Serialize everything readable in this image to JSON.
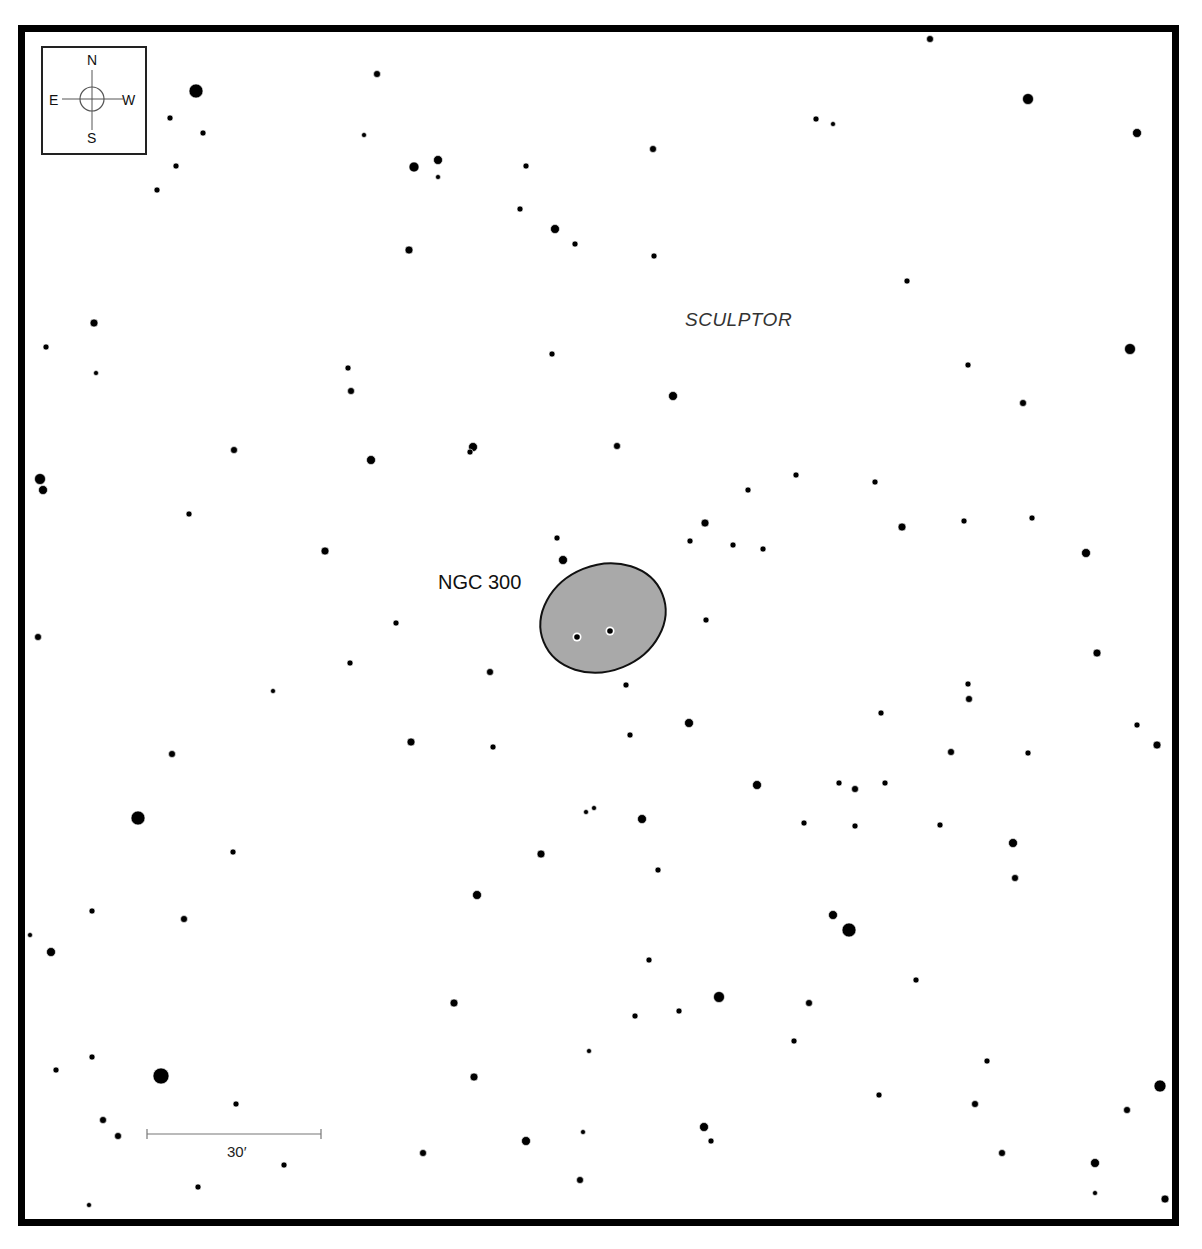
{
  "chart_data": {
    "type": "scatter",
    "constellation": "SCULPTOR",
    "object": {
      "name": "NGC 300",
      "shape": "ellipse",
      "center": [
        603,
        618
      ],
      "rx": 64,
      "ry": 53,
      "rotation_deg": -22,
      "fill": "#a9a9a9",
      "stroke": "#111111",
      "embedded_stars": [
        [
          577,
          637
        ],
        [
          610,
          631
        ]
      ]
    },
    "compass": {
      "N": "N",
      "S": "S",
      "E": "E",
      "W": "W"
    },
    "scale_bar": {
      "label": "30′",
      "x1": 147,
      "x2": 321,
      "y": 1134
    },
    "stars": [
      [
        930,
        39,
        3.5
      ],
      [
        377,
        74,
        3.5
      ],
      [
        196,
        91,
        7
      ],
      [
        1028,
        99,
        5.5
      ],
      [
        170,
        118,
        3
      ],
      [
        816,
        119,
        3
      ],
      [
        833,
        124,
        2.5
      ],
      [
        1137,
        133,
        4.5
      ],
      [
        203,
        133,
        3
      ],
      [
        364,
        135,
        2.5
      ],
      [
        653,
        149,
        3.5
      ],
      [
        438,
        160,
        4.5
      ],
      [
        414,
        167,
        5
      ],
      [
        176,
        166,
        3
      ],
      [
        526,
        166,
        3
      ],
      [
        438,
        177,
        2.5
      ],
      [
        157,
        190,
        3
      ],
      [
        520,
        209,
        3
      ],
      [
        555,
        229,
        4.5
      ],
      [
        575,
        244,
        3
      ],
      [
        409,
        250,
        4
      ],
      [
        654,
        256,
        3
      ],
      [
        907,
        281,
        3
      ],
      [
        94,
        323,
        4
      ],
      [
        46,
        347,
        3
      ],
      [
        1130,
        349,
        5.5
      ],
      [
        552,
        354,
        3
      ],
      [
        348,
        368,
        3
      ],
      [
        968,
        365,
        3
      ],
      [
        96,
        373,
        2.5
      ],
      [
        351,
        391,
        3.5
      ],
      [
        673,
        396,
        4.5
      ],
      [
        1023,
        403,
        3.5
      ],
      [
        473,
        447,
        4.5
      ],
      [
        470,
        452,
        3
      ],
      [
        617,
        446,
        3.5
      ],
      [
        234,
        450,
        3.5
      ],
      [
        371,
        460,
        4.5
      ],
      [
        40,
        479,
        5.5
      ],
      [
        43,
        490,
        4.5
      ],
      [
        796,
        475,
        3
      ],
      [
        875,
        482,
        3
      ],
      [
        748,
        490,
        3
      ],
      [
        189,
        514,
        3
      ],
      [
        705,
        523,
        4
      ],
      [
        1032,
        518,
        3
      ],
      [
        964,
        521,
        3
      ],
      [
        902,
        527,
        4
      ],
      [
        557,
        538,
        3
      ],
      [
        690,
        541,
        3
      ],
      [
        733,
        545,
        3
      ],
      [
        763,
        549,
        3
      ],
      [
        325,
        551,
        4
      ],
      [
        1086,
        553,
        4.5
      ],
      [
        563,
        560,
        4.5
      ],
      [
        706,
        620,
        3
      ],
      [
        396,
        623,
        3
      ],
      [
        38,
        637,
        3.5
      ],
      [
        1097,
        653,
        4
      ],
      [
        350,
        663,
        3
      ],
      [
        490,
        672,
        3.5
      ],
      [
        626,
        685,
        3
      ],
      [
        968,
        684,
        3
      ],
      [
        273,
        691,
        2.5
      ],
      [
        969,
        699,
        3.5
      ],
      [
        881,
        713,
        3
      ],
      [
        689,
        723,
        4.5
      ],
      [
        1137,
        725,
        3
      ],
      [
        630,
        735,
        3
      ],
      [
        411,
        742,
        4
      ],
      [
        1157,
        745,
        4
      ],
      [
        493,
        747,
        3
      ],
      [
        951,
        752,
        3.5
      ],
      [
        1028,
        753,
        3
      ],
      [
        172,
        754,
        3.5
      ],
      [
        757,
        785,
        4.5
      ],
      [
        839,
        783,
        3
      ],
      [
        885,
        783,
        3
      ],
      [
        855,
        789,
        3.5
      ],
      [
        586,
        812,
        2.5
      ],
      [
        594,
        808,
        2.5
      ],
      [
        138,
        818,
        7
      ],
      [
        642,
        819,
        4.5
      ],
      [
        804,
        823,
        3
      ],
      [
        855,
        826,
        3
      ],
      [
        940,
        825,
        3
      ],
      [
        1013,
        843,
        4.5
      ],
      [
        233,
        852,
        3
      ],
      [
        541,
        854,
        4
      ],
      [
        658,
        870,
        3
      ],
      [
        1015,
        878,
        3.5
      ],
      [
        477,
        895,
        4.5
      ],
      [
        92,
        911,
        3
      ],
      [
        184,
        919,
        3.5
      ],
      [
        833,
        915,
        4.5
      ],
      [
        849,
        930,
        7
      ],
      [
        30,
        935,
        2.5
      ],
      [
        51,
        952,
        4.5
      ],
      [
        649,
        960,
        3
      ],
      [
        916,
        980,
        3
      ],
      [
        719,
        997,
        5.5
      ],
      [
        454,
        1003,
        4
      ],
      [
        809,
        1003,
        3.5
      ],
      [
        635,
        1016,
        3
      ],
      [
        679,
        1011,
        3
      ],
      [
        794,
        1041,
        3
      ],
      [
        589,
        1051,
        2.5
      ],
      [
        92,
        1057,
        3
      ],
      [
        987,
        1061,
        3
      ],
      [
        56,
        1070,
        3
      ],
      [
        161,
        1076,
        8
      ],
      [
        474,
        1077,
        4
      ],
      [
        1160,
        1086,
        6
      ],
      [
        879,
        1095,
        3
      ],
      [
        236,
        1104,
        3
      ],
      [
        975,
        1104,
        3.5
      ],
      [
        1127,
        1110,
        3.5
      ],
      [
        103,
        1120,
        3.5
      ],
      [
        704,
        1127,
        4.5
      ],
      [
        118,
        1136,
        3.5
      ],
      [
        583,
        1132,
        2.5
      ],
      [
        711,
        1141,
        3
      ],
      [
        526,
        1141,
        4.5
      ],
      [
        423,
        1153,
        3.5
      ],
      [
        1002,
        1153,
        3.5
      ],
      [
        1095,
        1163,
        4.5
      ],
      [
        284,
        1165,
        3
      ],
      [
        580,
        1180,
        3.5
      ],
      [
        198,
        1187,
        3
      ],
      [
        1095,
        1193,
        2.5
      ],
      [
        1165,
        1199,
        4
      ],
      [
        89,
        1205,
        2.5
      ]
    ],
    "xlabel": "",
    "ylabel": "",
    "grid": false
  },
  "labels": {
    "object_name": "NGC 300",
    "constellation": "SCULPTOR",
    "scale": "30′",
    "compass_n": "N",
    "compass_s": "S",
    "compass_e": "E",
    "compass_w": "W"
  },
  "colors": {
    "star": "#000000",
    "galaxy_fill": "#a9a9a9",
    "frame": "#000000",
    "background": "#ffffff",
    "scale_bar": "#777777",
    "compass_lines": "#555555"
  }
}
